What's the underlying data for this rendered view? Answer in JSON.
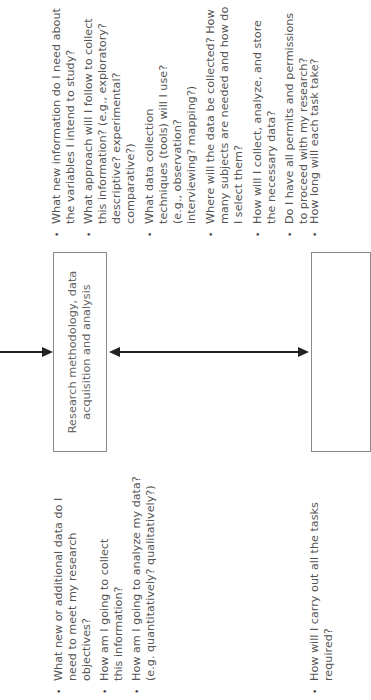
{
  "diagram": {
    "center_box": {
      "label": "Research methodology, data acquisition and analysis"
    },
    "right_box": {
      "label": ""
    },
    "top_questions": [
      "What new information do I need about the variables I intend to study?",
      "What approach will I follow to collect this information? (e.g., exploratory? descriptive? experimental? comparative?)",
      "What data collection techniques (tools) will I use? (e.g., observation? interviewing? mapping?)",
      "Where will the data be collected? How many subjects are needed and how do I select them?",
      "How will I collect, analyze, and store the necessary data?",
      "Do I have all permits and permissions to proceed with my research?",
      "How long will each task take?"
    ],
    "bottom_questions": [
      "What new or additional data do I need to meet my research objectives?",
      "How am I going to collect this information?",
      "How am I going to analyze my data? (e.g. quantitatively? qualitatively?)",
      "How will I carry out all the tasks required?"
    ],
    "bullet_glyph": "•",
    "colors": {
      "arrow": "#222222",
      "box_border": "#8a8a8a",
      "text": "#555555"
    }
  }
}
